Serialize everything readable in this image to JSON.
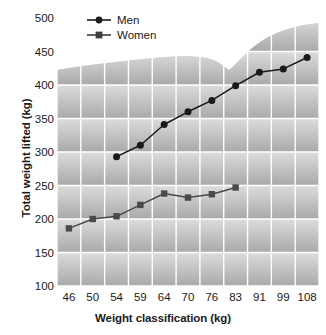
{
  "chart_data": {
    "type": "line",
    "title": "",
    "xlabel": "Weight classification (kg)",
    "ylabel": "Total weight lifted (kg)",
    "categories": [
      "46",
      "50",
      "54",
      "59",
      "64",
      "70",
      "76",
      "83",
      "91",
      "99",
      "108"
    ],
    "ylim": [
      100,
      500
    ],
    "yticks": [
      100,
      150,
      200,
      250,
      300,
      350,
      400,
      450,
      500
    ],
    "grid": true,
    "legend_position": "top-left",
    "series": [
      {
        "name": "Men",
        "marker": "circle",
        "color": "#1a1a1a",
        "x": [
          "54",
          "59",
          "64",
          "70",
          "76",
          "83",
          "91",
          "99",
          "108"
        ],
        "values": [
          293,
          310,
          341,
          360,
          377,
          399,
          419,
          424,
          441
        ]
      },
      {
        "name": "Women",
        "marker": "square",
        "color": "#4a4a4a",
        "x": [
          "46",
          "50",
          "54",
          "59",
          "64",
          "70",
          "76",
          "83"
        ],
        "values": [
          186,
          200,
          204,
          221,
          238,
          232,
          237,
          247
        ]
      }
    ]
  },
  "legend": {
    "entries": [
      {
        "label": "Men",
        "marker": "circle-marker"
      },
      {
        "label": "Women",
        "marker": "square-marker"
      }
    ]
  },
  "axes": {
    "y_title": "Total weight lifted (kg)",
    "x_title": "Weight classification (kg)"
  },
  "colors": {
    "men_line": "#1a1a1a",
    "women_line": "#4a4a4a",
    "gridline": "#ffffff",
    "plot_background_light": "#e8e8e8",
    "plot_background_dark": "#b4b4b4",
    "text": "#1a1a1a"
  }
}
